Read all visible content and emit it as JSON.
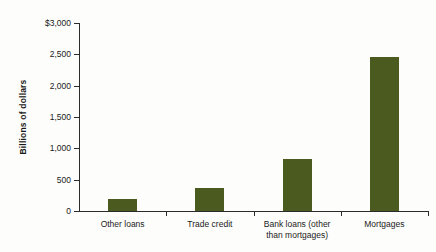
{
  "chart_data": {
    "type": "bar",
    "title": "",
    "subtitle": "",
    "xlabel": "",
    "ylabel": "Billions of dollars",
    "categories": [
      "Other loans",
      "Trade credit",
      "Bank loans (other\nthan mortgages)",
      "Mortgages"
    ],
    "values": [
      190,
      370,
      830,
      2460
    ],
    "ylim": [
      0,
      3000
    ],
    "yticks": [
      0,
      500,
      1000,
      1500,
      2000,
      2500,
      3000
    ],
    "ytick_labels": [
      "0",
      "500",
      "1,000",
      "1,500",
      "2,000",
      "2,500",
      "$3,000"
    ],
    "grid": false,
    "legend": null,
    "bar_color": "#4b5a1f",
    "axis_color": "#2b2b2b",
    "background_color": "#fdfdfb",
    "units": "Billions of dollars"
  },
  "axes": {
    "y_title": "Billions of dollars",
    "y_tick_labels": [
      "$3,000",
      "2,500",
      "2,000",
      "1,500",
      "1,000",
      "500",
      "0"
    ],
    "x_tick_labels": [
      "Other loans",
      "Trade credit",
      "Bank loans (other\nthan mortgages)",
      "Mortgages"
    ]
  }
}
